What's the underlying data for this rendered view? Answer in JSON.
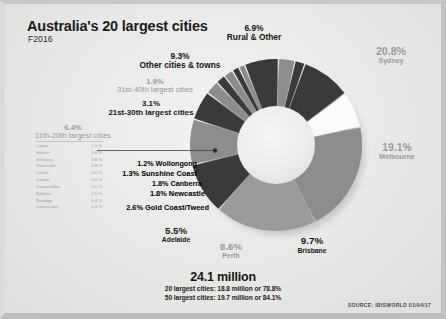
{
  "header": {
    "title": "Australia's 20 largest cities",
    "subtitle": "F2016"
  },
  "source": "SOURCE: IBISWORLD 01/04/17",
  "totals": {
    "headline": "24.1 million",
    "line1": "20 largest cities: 18.8 million or 78.8%",
    "line2": "50 largest cities: 19.7 million or 84.1%"
  },
  "labels": {
    "rural": {
      "pct": "6.9%",
      "name": "Rural & Other"
    },
    "other_towns": {
      "pct": "9.3%",
      "name": "Other cities & towns"
    },
    "c31_40": {
      "pct": "1.9%",
      "name": "31st-40th largest cities"
    },
    "c21_30": {
      "pct": "3.1%",
      "name": "21st-30th largest cities"
    },
    "c11_20": {
      "pct": "6.4%",
      "name": "11th-20th largest cities"
    },
    "wollongong": {
      "text": "1.2% Wollongong"
    },
    "sunshine": {
      "text": "1.3% Sunshine Coast"
    },
    "canberra": {
      "text": "1.8% Canberra"
    },
    "newcastle": {
      "text": "1.8% Newcastle"
    },
    "goldcoast": {
      "text": "2.6% Gold Coast/Tweed"
    },
    "adelaide": {
      "pct": "5.5%",
      "name": "Adelaide"
    },
    "perth": {
      "pct": "8.6%",
      "name": "Perth"
    },
    "brisbane": {
      "pct": "9.7%",
      "name": "Brisbane"
    },
    "melbourne": {
      "pct": "19.1%",
      "name": "Melbourne"
    },
    "sydney": {
      "pct": "20.8%",
      "name": "Sydney"
    }
  },
  "city_list": [
    {
      "name": "Logan",
      "value": "1.1 %"
    },
    {
      "name": "Hobart",
      "value": "0.8 %"
    },
    {
      "name": "Geelong",
      "value": "0.8 %"
    },
    {
      "name": "Townsville",
      "value": "0.8 %"
    },
    {
      "name": "Cairns",
      "value": "0.6 %"
    },
    {
      "name": "Darwin",
      "value": "0.6 %"
    },
    {
      "name": "Toowoomba",
      "value": "0.5 %"
    },
    {
      "name": "Ballarat",
      "value": "0.5 %"
    },
    {
      "name": "Bendigo",
      "value": "0.4 %"
    },
    {
      "name": "Launceston",
      "value": "0.4 %"
    }
  ],
  "colors": {
    "dark": "#3a3a3a",
    "mid": "#8d8d8d",
    "white": "#fbfbf9",
    "background": "#e9e9e7",
    "text_dark": "#161616",
    "text_grey": "#9a9a9a"
  },
  "chart_data": {
    "type": "pie",
    "title": "Australia's 20 largest cities",
    "subtitle": "F2016",
    "hole": 0.45,
    "start_angle_deg": -12,
    "direction": "clockwise",
    "legend": "none",
    "categories": [
      "Sydney",
      "Melbourne",
      "Brisbane",
      "Perth",
      "Adelaide",
      "Gold Coast/Tweed",
      "Newcastle",
      "Canberra",
      "Sunshine Coast",
      "Wollongong",
      "11th-20th largest cities",
      "21st-30th largest cities",
      "31st-40th largest cities",
      "Other cities & towns",
      "Rural & Other"
    ],
    "values": [
      20.8,
      19.1,
      9.7,
      8.6,
      5.5,
      2.6,
      1.8,
      1.8,
      1.3,
      1.2,
      6.4,
      3.1,
      1.9,
      9.3,
      6.9
    ],
    "unit": "percent of population",
    "slice_colors": [
      "#8d8d8d",
      "#9a9a9a",
      "#3a3a3a",
      "#8d8d8d",
      "#3a3a3a",
      "#8d8d8d",
      "#3a3a3a",
      "#8d8d8d",
      "#3a3a3a",
      "#8d8d8d",
      "#3a3a3a",
      "#8d8d8d",
      "#3a3a3a",
      "#3a3a3a",
      "#fbfbf9"
    ],
    "annotations": [
      "24.1 million",
      "20 largest cities: 18.8 million or 78.8%",
      "50 largest cities: 19.7 million or 84.1%"
    ]
  }
}
